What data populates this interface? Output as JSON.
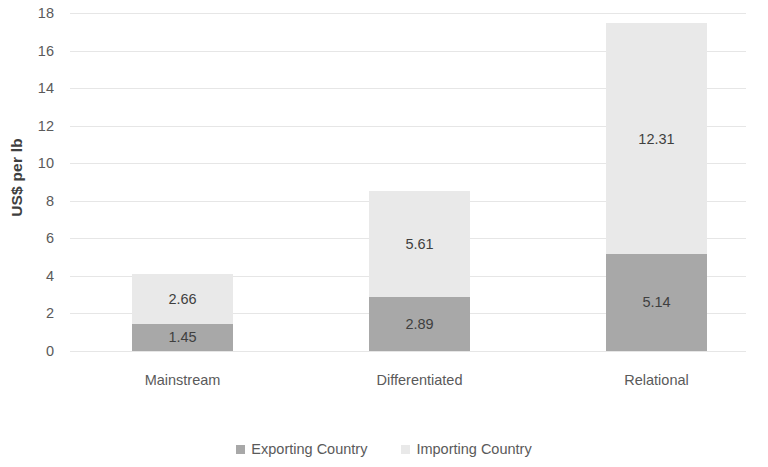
{
  "chart_data": {
    "type": "bar",
    "stacked": true,
    "title": "",
    "subtitle": "",
    "xlabel": "",
    "ylabel": "US$ per lb",
    "categories": [
      "Mainstream",
      "Differentiated",
      "Relational"
    ],
    "series": [
      {
        "name": "Exporting Country",
        "color": "#a8a8a8",
        "values": [
          1.45,
          2.89,
          5.14
        ],
        "labels": [
          "1.45",
          "2.89",
          "5.14"
        ]
      },
      {
        "name": "Importing Country",
        "color": "#e9e9e9",
        "values": [
          2.66,
          5.61,
          12.31
        ],
        "labels": [
          "2.66",
          "5.61",
          "12.31"
        ]
      }
    ],
    "totals": [
      4.11,
      8.5,
      17.45
    ],
    "ylim": [
      0,
      18
    ],
    "ytick_step": 2,
    "yticks": [
      18,
      16,
      14,
      12,
      10,
      8,
      6,
      4,
      2,
      0
    ],
    "ytick_labels": [
      "18",
      "16",
      "14",
      "12",
      "10",
      "8",
      "6",
      "4",
      "2",
      "0"
    ],
    "grid": true,
    "grid_color": "#e6e6e6",
    "legend_position": "bottom",
    "background": "#ffffff",
    "text_color": "#5a5a5a"
  },
  "axis": {
    "y_title": "US$ per lb"
  },
  "legend": {
    "items": [
      {
        "label": "Exporting Country",
        "swatch": "exporting"
      },
      {
        "label": "Importing Country",
        "swatch": "importing"
      }
    ]
  }
}
